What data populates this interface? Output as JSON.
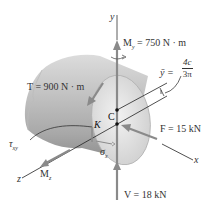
{
  "diagram": {
    "axes": {
      "y": "y",
      "x": "x",
      "z": "z"
    },
    "points": {
      "centroid": "C",
      "point": "K"
    },
    "loads": {
      "My": {
        "symbol": "M",
        "sub": "y",
        "text": " = 750 N · m"
      },
      "T": {
        "text": "T = 900 N · m"
      },
      "F": {
        "text": "F = 15 kN"
      },
      "V": {
        "text": "V = 18 kN"
      },
      "Mz": {
        "symbol": "M",
        "sub": "z"
      }
    },
    "stresses": {
      "tau": {
        "symbol": "τ",
        "sub": "xy"
      },
      "sigma": {
        "symbol": "σ",
        "sub": "x"
      }
    },
    "centroid_formula": {
      "lhs": "ȳ =",
      "numerator": "4c",
      "denominator": "3π"
    },
    "colors": {
      "arrow": "#8a8a8a",
      "line": "#222222",
      "cylinder_light": "#e6e6e6",
      "cylinder_dark": "#9a9a9a",
      "text": "#333333"
    }
  }
}
